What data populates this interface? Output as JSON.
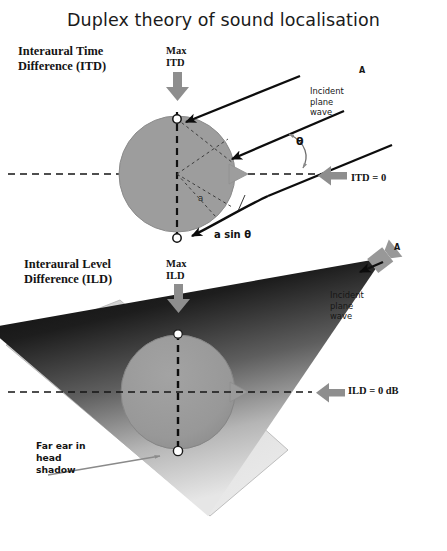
{
  "figure": {
    "title": "Duplex theory of sound localisation",
    "type": "scientific-diagram",
    "background_color": "#ffffff",
    "head_fill": "#9a9a9a",
    "ear_marker_color": "#ffffff",
    "accent_gray": "#8c8c8c"
  },
  "panels": {
    "top": {
      "label": "Interaural Time\nDifference (ITD)",
      "max_label": "Max\nITD",
      "equal_label": "ITD = 0",
      "source_marker": "A",
      "wave_label": "Incident\nplane\nwave",
      "angle_symbol": "θ",
      "path_difference_label": "a sin θ",
      "radius_label": "a"
    },
    "bottom": {
      "label": "Interaural Level\nDifference (ILD)",
      "max_label": "Max\nILD",
      "equal_label": "ILD = 0 dB",
      "source_marker": "A",
      "wave_label": "Incident\nplane\nwave",
      "shadow_label": "Far ear in\nhead\nshadow"
    }
  },
  "icons": {
    "max_arrow": "down-arrow-icon",
    "equal_arrow": "left-arrow-icon",
    "source": "loudspeaker-icon",
    "pointer": "callout-arrow-icon"
  }
}
